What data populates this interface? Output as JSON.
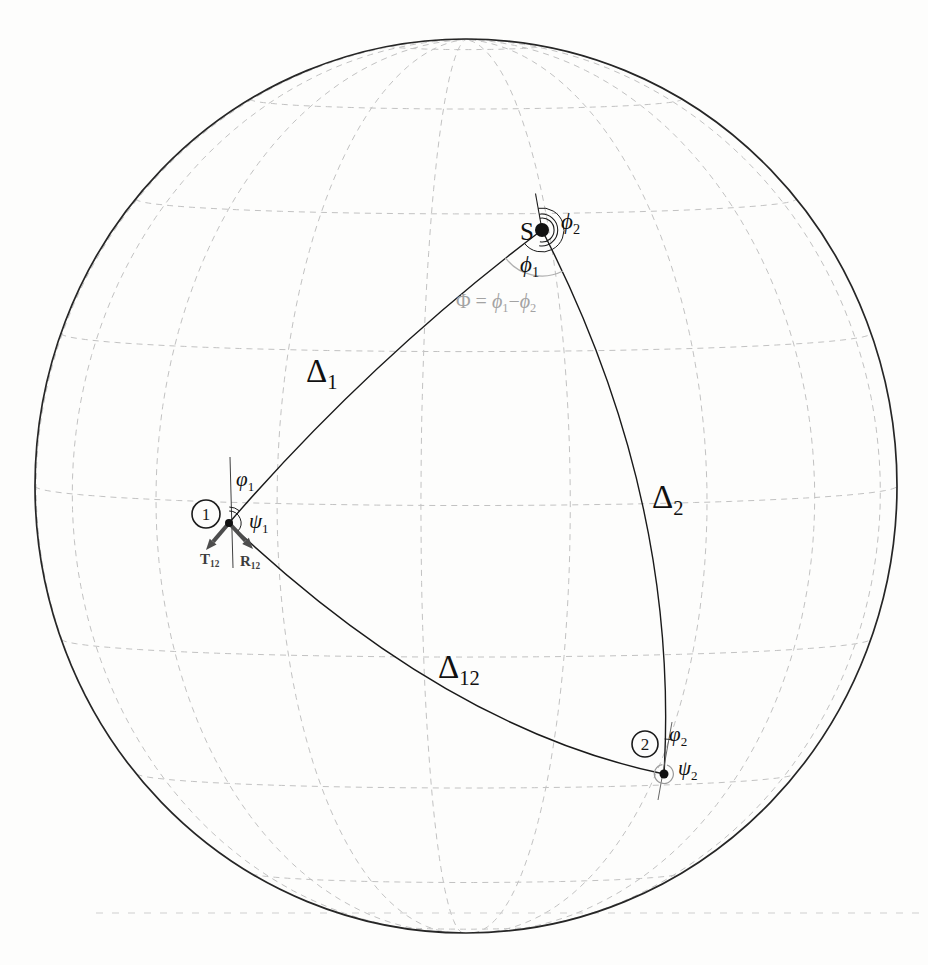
{
  "figure": {
    "background": "#fdfdfc",
    "canvas": {
      "width": 928,
      "height": 965
    },
    "sphere": {
      "cx": 466,
      "cy": 486,
      "rx": 431,
      "ry": 447,
      "tilt_deg": 2.5,
      "lon0_deg": 6,
      "meridian_step_deg": 20,
      "parallel_step_deg": 20,
      "grid_color": "#c2c2c2",
      "grid_dash": "6 5",
      "grid_width": 1,
      "rim_color": "#262626",
      "rim_width": 1.7
    },
    "artifact_line": {
      "y": 913,
      "x1": 96,
      "x2": 924,
      "color": "#cfcfcf",
      "dash": "7 9",
      "width": 1
    },
    "triangle_arcs": [
      {
        "id": "arc-delta1",
        "from": [
          229,
          523
        ],
        "ctrl": [
          370,
          360
        ],
        "to": [
          542,
          230
        ],
        "color": "#1a1a1a",
        "width": 1.4
      },
      {
        "id": "arc-delta2",
        "from": [
          542,
          230
        ],
        "ctrl": [
          680,
          498
        ],
        "to": [
          664,
          774
        ],
        "color": "#1a1a1a",
        "width": 1.4
      },
      {
        "id": "arc-delta12",
        "from": [
          229,
          523
        ],
        "ctrl": [
          446,
          729
        ],
        "to": [
          664,
          774
        ],
        "color": "#1a1a1a",
        "width": 1.4
      }
    ],
    "thin_lines": [
      {
        "id": "source-north-line",
        "x1": 542,
        "y1": 230,
        "x2": 535.5,
        "y2": 193.5,
        "color": "#1a1a1a",
        "width": 1.1
      },
      {
        "id": "station1-meridian-line",
        "x1": 230,
        "y1": 457,
        "x2": 233,
        "y2": 568,
        "color": "#2a2a2a",
        "width": 0.9
      },
      {
        "id": "station2-meridian-line",
        "x1": 672,
        "y1": 722,
        "x2": 658,
        "y2": 800,
        "color": "#555555",
        "width": 0.9
      }
    ],
    "angle_arcs": [
      {
        "id": "phi2-source-arc-inner",
        "cx": 542,
        "cy": 230,
        "r": 12,
        "a1": -10,
        "a2": 190,
        "color": "#1a1a1a",
        "width": 1.1
      },
      {
        "id": "phi2-source-arc-outer",
        "cx": 542,
        "cy": 230,
        "r": 16,
        "a1": -10,
        "a2": 190,
        "color": "#1a1a1a",
        "width": 1.1
      },
      {
        "id": "phi1-source-arc",
        "cx": 542,
        "cy": 230,
        "r": 22,
        "a1": -10,
        "a2": 233,
        "color": "#1a1a1a",
        "width": 1.0
      },
      {
        "id": "Phi-difference-arc",
        "cx": 542,
        "cy": 230,
        "r": 46,
        "a1": 153,
        "a2": 233,
        "color": "#b0b0b0",
        "width": 1.2
      },
      {
        "id": "varphi1-station1-arc",
        "cx": 229,
        "cy": 523,
        "r": 16,
        "a1": 1,
        "a2": 41,
        "color": "#1a1a1a",
        "width": 1.0
      },
      {
        "id": "psi1-station1-arc",
        "cx": 229,
        "cy": 523,
        "r": 12,
        "a1": 1,
        "a2": 133,
        "color": "#1a1a1a",
        "width": 1.0
      },
      {
        "id": "varphi2-station2-arc",
        "cx": 664,
        "cy": 774,
        "r": 35,
        "a1": 1,
        "a2": 15,
        "color": "#1a1a1a",
        "width": 0.9
      },
      {
        "id": "psi2-station2-circle",
        "cx": 664,
        "cy": 774,
        "r": 9.5,
        "a1": 18,
        "a2": 350,
        "color": "#999999",
        "width": 1.2
      }
    ],
    "vectors": {
      "color": "#4d4d4d",
      "width": 4,
      "head_length": 11,
      "head_width": 9,
      "items": [
        {
          "id": "vector-T12",
          "from": [
            229,
            523
          ],
          "to": [
            206,
            550
          ]
        },
        {
          "id": "vector-R12",
          "from": [
            229,
            523
          ],
          "to": [
            253,
            549
          ]
        }
      ]
    },
    "dots": [
      {
        "id": "source-dot",
        "x": 542,
        "y": 230,
        "r": 7,
        "fill": "#111111"
      },
      {
        "id": "station1-dot",
        "x": 229,
        "y": 523,
        "r": 4,
        "fill": "#111111"
      },
      {
        "id": "station2-dot",
        "x": 664,
        "y": 774,
        "r": 4.5,
        "fill": "#111111"
      }
    ],
    "circled_numbers": [
      {
        "id": "station1-marker",
        "x": 206,
        "y": 514,
        "r": 14,
        "digit": "1",
        "stroke": "#1a1a1a",
        "width": 1.6,
        "font_size": 17
      },
      {
        "id": "station2-marker",
        "x": 645,
        "y": 744,
        "r": 13,
        "digit": "2",
        "stroke": "#1a1a1a",
        "width": 1.6,
        "font_size": 17
      }
    ],
    "labels": [
      {
        "id": "label-source-S",
        "x": 534,
        "y": 240,
        "anchor": "end",
        "size": 25,
        "color": "#111111",
        "segs": [
          {
            "t": "S"
          }
        ]
      },
      {
        "id": "label-phi2-source",
        "x": 561,
        "y": 229,
        "anchor": "start",
        "size": 23,
        "color": "#111111",
        "segs": [
          {
            "t": "ϕ",
            "it": true
          },
          {
            "t": "2",
            "sub": true
          }
        ]
      },
      {
        "id": "label-phi1-source",
        "x": 520,
        "y": 272,
        "anchor": "start",
        "size": 23,
        "color": "#111111",
        "segs": [
          {
            "t": "ϕ",
            "it": true
          },
          {
            "t": "1",
            "sub": true
          }
        ]
      },
      {
        "id": "label-Phi-equation",
        "x": 456,
        "y": 308,
        "anchor": "start",
        "size": 20,
        "color": "#a3a3a3",
        "segs": [
          {
            "t": "Φ = "
          },
          {
            "t": "ϕ",
            "it": true
          },
          {
            "t": "1",
            "sub": true
          },
          {
            "t": "−"
          },
          {
            "t": "ϕ",
            "it": true
          },
          {
            "t": "2",
            "sub": true
          }
        ]
      },
      {
        "id": "label-Delta1",
        "x": 306,
        "y": 382,
        "anchor": "start",
        "size": 33,
        "color": "#111111",
        "segs": [
          {
            "t": "Δ"
          },
          {
            "t": "1",
            "sub": true
          }
        ]
      },
      {
        "id": "label-Delta2",
        "x": 652,
        "y": 508,
        "anchor": "start",
        "size": 33,
        "color": "#111111",
        "segs": [
          {
            "t": "Δ"
          },
          {
            "t": "2",
            "sub": true
          }
        ]
      },
      {
        "id": "label-Delta12",
        "x": 438,
        "y": 678,
        "anchor": "start",
        "size": 33,
        "color": "#111111",
        "segs": [
          {
            "t": "Δ"
          },
          {
            "t": "12",
            "sub": true
          }
        ]
      },
      {
        "id": "label-varphi1-station1",
        "x": 236,
        "y": 486,
        "anchor": "start",
        "size": 21,
        "color": "#111111",
        "segs": [
          {
            "t": "φ",
            "it": true
          },
          {
            "t": "1",
            "sub": true
          }
        ]
      },
      {
        "id": "label-psi1-station1",
        "x": 249,
        "y": 528,
        "anchor": "start",
        "size": 21,
        "color": "#111111",
        "segs": [
          {
            "t": "ψ",
            "it": true
          },
          {
            "t": "1",
            "sub": true
          }
        ]
      },
      {
        "id": "label-T12",
        "x": 200,
        "y": 564,
        "anchor": "start",
        "size": 15,
        "color": "#3d3d3d",
        "bold": true,
        "segs": [
          {
            "t": "T"
          },
          {
            "t": "12",
            "sub": true
          }
        ]
      },
      {
        "id": "label-R12",
        "x": 240,
        "y": 566,
        "anchor": "start",
        "size": 15,
        "color": "#3d3d3d",
        "bold": true,
        "segs": [
          {
            "t": "R"
          },
          {
            "t": "12",
            "sub": true
          }
        ]
      },
      {
        "id": "label-varphi2-station2",
        "x": 669,
        "y": 741,
        "anchor": "start",
        "size": 21,
        "color": "#111111",
        "segs": [
          {
            "t": "φ",
            "it": true
          },
          {
            "t": "2",
            "sub": true
          }
        ]
      },
      {
        "id": "label-psi2-station2",
        "x": 678,
        "y": 775,
        "anchor": "start",
        "size": 21,
        "color": "#111111",
        "segs": [
          {
            "t": "ψ",
            "it": true
          },
          {
            "t": "2",
            "sub": true
          }
        ]
      }
    ]
  }
}
